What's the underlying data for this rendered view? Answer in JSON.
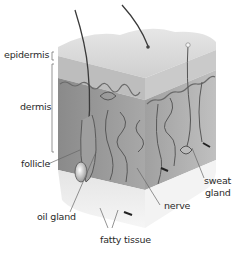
{
  "diagram": {
    "labels": {
      "epidermis": "epidermis",
      "dermis": "dermis",
      "follicle": "follicle",
      "oil_gland": "oil gland",
      "fatty_tissue": "fatty tissue",
      "nerve": "nerve",
      "sweat_gland_line1": "sweat",
      "sweat_gland_line2": "gland"
    },
    "colors": {
      "background": "#ffffff",
      "surface_top": "#dcdcdc",
      "epidermis_band": "#c4c4c4",
      "dermis_front": "#9a9a9a",
      "dermis_side": "#b0b0b0",
      "fatty_front": "#eeeeee",
      "fatty_side": "#f4f4f4",
      "structure_lines": "#555555",
      "label_text": "#2a2a2a",
      "leader_lines": "#666666"
    }
  }
}
